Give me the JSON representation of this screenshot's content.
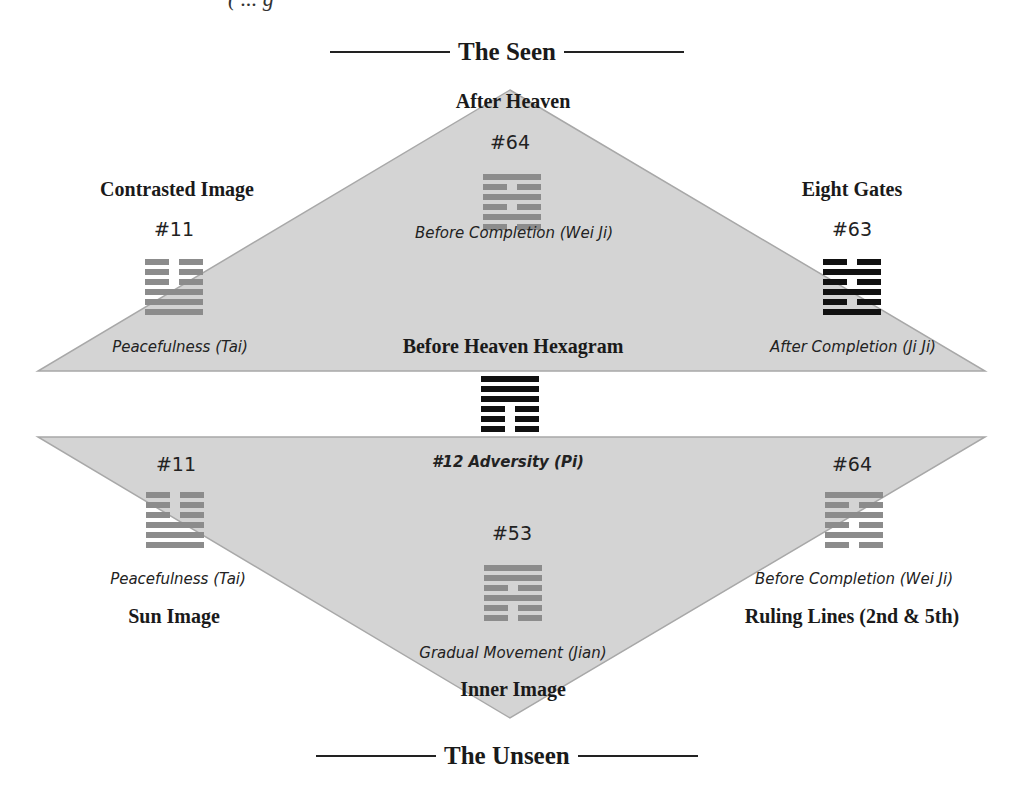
{
  "top_fragment": "( ... g",
  "headings": {
    "top": "The Seen",
    "bottom": "The Unseen"
  },
  "colors": {
    "triangle_fill": "#d4d4d4",
    "triangle_edge": "#a8a8a8",
    "hex_gray": "#8c8c8c",
    "hex_black": "#111111"
  },
  "upper": {
    "apex_label": "After Heaven",
    "center_label": "Before Heaven Hexagram",
    "left": {
      "label": "Contrasted Image",
      "number": "#11",
      "name": "Peacefulness (Tai)",
      "lines_top_to_bottom": [
        "broken",
        "broken",
        "broken",
        "solid",
        "solid",
        "solid"
      ],
      "color": "gray"
    },
    "center": {
      "number": "#64",
      "name": "Before Completion (Wei Ji)",
      "lines_top_to_bottom": [
        "solid",
        "broken",
        "solid",
        "broken",
        "solid",
        "broken"
      ],
      "color": "gray"
    },
    "right": {
      "label": "Eight Gates",
      "number": "#63",
      "name": "After Completion (Ji Ji)",
      "lines_top_to_bottom": [
        "broken",
        "solid",
        "broken",
        "solid",
        "broken",
        "solid"
      ],
      "color": "black"
    }
  },
  "middle": {
    "number_name": "#12 Adversity (Pi)",
    "lines_top_to_bottom": [
      "solid",
      "solid",
      "solid",
      "broken",
      "broken",
      "broken"
    ],
    "color": "black"
  },
  "lower": {
    "apex_label": "Inner Image",
    "left": {
      "label": "Sun Image",
      "number": "#11",
      "name": "Peacefulness (Tai)",
      "lines_top_to_bottom": [
        "broken",
        "broken",
        "broken",
        "solid",
        "solid",
        "solid"
      ],
      "color": "gray"
    },
    "center": {
      "label": "Inner Image",
      "number": "#53",
      "name": "Gradual Movement (Jian)",
      "lines_top_to_bottom": [
        "solid",
        "solid",
        "broken",
        "solid",
        "broken",
        "broken"
      ],
      "color": "gray"
    },
    "right": {
      "label": "Ruling Lines (2nd & 5th)",
      "number": "#64",
      "name": "Before Completion (Wei Ji)",
      "lines_top_to_bottom": [
        "solid",
        "broken",
        "solid",
        "broken",
        "solid",
        "broken"
      ],
      "color": "gray"
    }
  }
}
